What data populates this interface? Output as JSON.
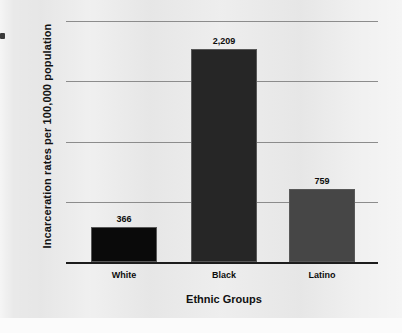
{
  "chart_data": {
    "type": "bar",
    "title": "",
    "xlabel": "Ethnic Groups",
    "ylabel": "Incarceration rates per 100,000 population",
    "categories": [
      "White",
      "Black",
      "Latino"
    ],
    "values": [
      366,
      2209,
      759
    ],
    "value_labels": [
      "366",
      "2,209",
      "759"
    ],
    "ylim": [
      0,
      2500
    ],
    "yticks": [
      0,
      625,
      1250,
      1875,
      2500
    ],
    "ytick_labels": [
      "0",
      "625",
      "1,250",
      "1,875",
      "2,500"
    ],
    "grid": true,
    "legend": "none",
    "bar_colors": [
      "#0a0a0a",
      "#262626",
      "#464646"
    ],
    "background_color": "#e9e9e9",
    "gridline_color": "#8c8c8c",
    "axis_color": "#1c1c1c"
  }
}
